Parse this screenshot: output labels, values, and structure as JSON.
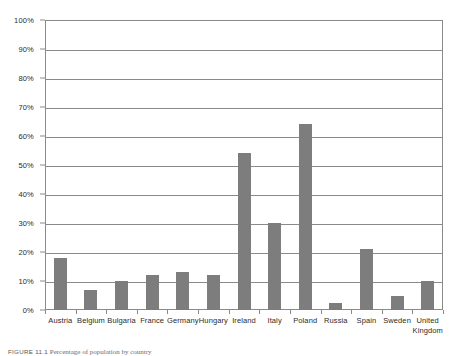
{
  "chart_data": {
    "type": "bar",
    "title": "",
    "xlabel": "",
    "ylabel": "",
    "ylim": [
      0,
      100
    ],
    "grid": true,
    "legend": "none",
    "y_unit": "%",
    "categories": [
      "Austria",
      "Belgium",
      "Bulgaria",
      "France",
      "Germany",
      "Hungary",
      "Ireland",
      "Italy",
      "Poland",
      "Russia",
      "Spain",
      "Sweden",
      "United Kingdom"
    ],
    "values": [
      18,
      7,
      10,
      12,
      13,
      12,
      54,
      30,
      64,
      2.5,
      21,
      5,
      10
    ],
    "y_ticks": [
      "0%",
      "10%",
      "20%",
      "30%",
      "40%",
      "50%",
      "60%",
      "70%",
      "80%",
      "90%",
      "100%"
    ],
    "y_tick_values": [
      0,
      10,
      20,
      30,
      40,
      50,
      60,
      70,
      80,
      90,
      100
    ],
    "bar_color": "#7d7d7d",
    "grid_color": "#8a8a8a",
    "background_color": "#ffffff"
  },
  "caption": {
    "figure_number": "FIGURE 11.1",
    "text": "Percentage of population by country"
  }
}
